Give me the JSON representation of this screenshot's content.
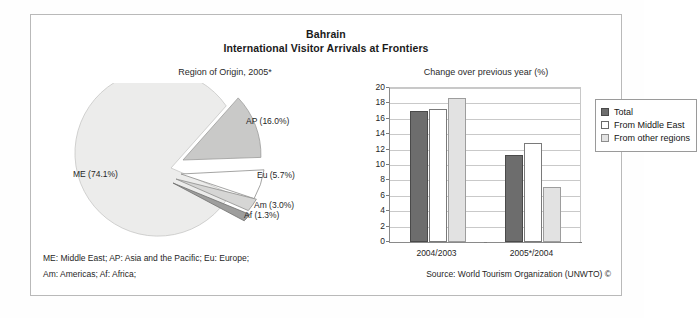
{
  "figure": {
    "title": "Bahrain",
    "subtitle": "International Visitor Arrivals at Frontiers",
    "pie_caption": "Region of Origin, 2005*",
    "bar_caption": "Change over previous year (%)",
    "abbrev_line1": "ME: Middle East; AP: Asia and the Pacific; Eu: Europe;",
    "abbrev_line2": "Am: Americas; Af: Africa;",
    "source": "Source: World Tourism Organization (UNWTO) ©"
  },
  "chart_data": [
    {
      "type": "pie",
      "title": "Region of Origin, 2005*",
      "labels": [
        "ME (74.1%)",
        "AP (16.0%)",
        "Eu (5.7%)",
        "Am (3.0%)",
        "Af (1.3%)"
      ],
      "categories": [
        "ME",
        "AP",
        "Eu",
        "Am",
        "Af"
      ],
      "values": [
        74.1,
        16.0,
        5.7,
        3.0,
        1.3
      ],
      "unit": "%",
      "colors": [
        "#ececeb",
        "#c9c9c8",
        "#ffffff",
        "#d6d6d5",
        "#9e9e9d"
      ],
      "exploded": [
        false,
        true,
        true,
        true,
        true
      ],
      "legend": "none"
    },
    {
      "type": "bar",
      "title": "Change over previous year (%)",
      "categories": [
        "2004/2003",
        "2005*/2004"
      ],
      "series": [
        {
          "name": "Total",
          "values": [
            17.0,
            11.3
          ],
          "color": "#6d6d6d"
        },
        {
          "name": "From Middle East",
          "values": [
            17.3,
            12.9
          ],
          "color": "#ffffff"
        },
        {
          "name": "From other regions",
          "values": [
            18.7,
            7.1
          ],
          "color": "#e2e2e2"
        }
      ],
      "ylabel": "",
      "xlabel": "",
      "ylim": [
        0,
        20
      ],
      "yticks": [
        0,
        2,
        4,
        6,
        8,
        10,
        12,
        14,
        16,
        18,
        20
      ],
      "ytick_labels": [
        "0",
        "2",
        "4",
        "6",
        "8",
        "10",
        "12",
        "14",
        "16",
        "18",
        "20"
      ],
      "grid": true,
      "legend_position": "right"
    }
  ]
}
